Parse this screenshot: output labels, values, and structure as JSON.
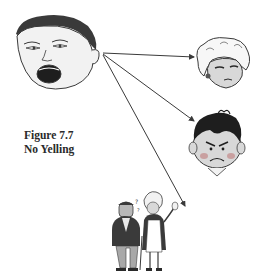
{
  "figure": {
    "number_label": "Figure 7.7",
    "title": "No Yelling"
  },
  "diagram": {
    "source": {
      "name": "yelling-child-face",
      "description": "Child's face with wide-open mouth, yelling"
    },
    "targets": [
      {
        "name": "annoyed-woman-face",
        "description": "Woman with curly white hair, side-eye annoyed expression"
      },
      {
        "name": "angry-boy-face",
        "description": "Boy with black hair, angry frowning face, red cheeks"
      },
      {
        "name": "elderly-couple",
        "description": "Elderly man and woman standing, startled"
      }
    ],
    "arrows": [
      {
        "from": "yelling-child-face",
        "to": "annoyed-woman-face"
      },
      {
        "from": "yelling-child-face",
        "to": "angry-boy-face"
      },
      {
        "from": "yelling-child-face",
        "to": "elderly-couple"
      }
    ],
    "colors": {
      "line": "#3a3a3a",
      "skin_gray": "#d8d8d8",
      "hair_dark": "#2b2b2b",
      "cheek": "#c9a0a0"
    }
  }
}
